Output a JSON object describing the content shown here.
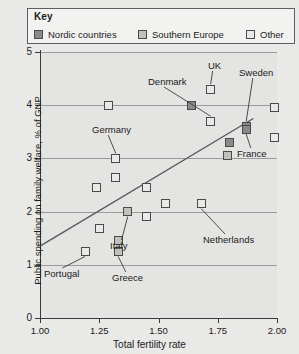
{
  "legend": {
    "title": "Key",
    "entries": [
      {
        "label": "Nordic countries",
        "key": "nordic",
        "color": "#8a8a8a"
      },
      {
        "label": "Southern Europe",
        "key": "south",
        "color": "#c0c0bd"
      },
      {
        "label": "Other",
        "key": "other",
        "color": "#e9e9e7"
      }
    ]
  },
  "axes": {
    "y_label": "Public spending on family welfare, % of GNP",
    "x_label": "Total fertility rate",
    "y_ticks": [
      "0",
      "1",
      "2",
      "3",
      "4",
      "5"
    ],
    "x_ticks": [
      "1.00",
      "1.25",
      "1.50",
      "1.75",
      "2.00"
    ]
  },
  "annotations": [
    {
      "text": "Denmark",
      "x": 148,
      "y": 76
    },
    {
      "text": "UK",
      "x": 208,
      "y": 60
    },
    {
      "text": "Sweden",
      "x": 239,
      "y": 67
    },
    {
      "text": "Germany",
      "x": 92,
      "y": 124
    },
    {
      "text": "France",
      "x": 237,
      "y": 148
    },
    {
      "text": "Netherlands",
      "x": 203,
      "y": 234
    },
    {
      "text": "Italy",
      "x": 110,
      "y": 240
    },
    {
      "text": "Portugal",
      "x": 44,
      "y": 268
    },
    {
      "text": "Greece",
      "x": 112,
      "y": 272
    }
  ],
  "chart_data": {
    "type": "scatter",
    "title": "",
    "xlabel": "Total fertility rate",
    "ylabel": "Public spending on family welfare, % of GNP",
    "xlim": [
      1.0,
      2.0
    ],
    "ylim": [
      0,
      5
    ],
    "xticks": [
      1.0,
      1.25,
      1.5,
      1.75,
      2.0
    ],
    "yticks": [
      0,
      1,
      2,
      3,
      4,
      5
    ],
    "grid": "horizontal",
    "legend_position": "top",
    "groups": [
      "Nordic countries",
      "Southern Europe",
      "Other"
    ],
    "trendline": {
      "x": [
        1.0,
        1.9
      ],
      "y": [
        1.35,
        3.75
      ]
    },
    "points": [
      {
        "label": "Denmark",
        "group": "Other",
        "x": 1.72,
        "y": 3.7
      },
      {
        "label": "UK",
        "group": "Other",
        "x": 1.72,
        "y": 4.3
      },
      {
        "label": "Sweden",
        "group": "Nordic countries",
        "x": 1.87,
        "y": 3.6
      },
      {
        "label": "Germany",
        "group": "Other",
        "x": 1.32,
        "y": 3.0
      },
      {
        "label": "France",
        "group": "Nordic countries",
        "x": 1.87,
        "y": 3.55
      },
      {
        "label": "Netherlands",
        "group": "Other",
        "x": 1.68,
        "y": 2.15
      },
      {
        "label": "Italy",
        "group": "Southern Europe",
        "x": 1.37,
        "y": 2.0
      },
      {
        "label": "Portugal",
        "group": "Other",
        "x": 1.19,
        "y": 1.25
      },
      {
        "label": "Greece",
        "group": "Southern Europe",
        "x": 1.33,
        "y": 1.25
      },
      {
        "label": "",
        "group": "Other",
        "x": 1.29,
        "y": 4.0
      },
      {
        "label": "",
        "group": "Nordic countries",
        "x": 1.64,
        "y": 4.0
      },
      {
        "label": "",
        "group": "Other",
        "x": 1.99,
        "y": 3.95
      },
      {
        "label": "",
        "group": "Other",
        "x": 1.99,
        "y": 3.4
      },
      {
        "label": "",
        "group": "Nordic countries",
        "x": 1.8,
        "y": 3.3
      },
      {
        "label": "",
        "group": "Southern Europe",
        "x": 1.79,
        "y": 3.05
      },
      {
        "label": "",
        "group": "Other",
        "x": 1.32,
        "y": 2.65
      },
      {
        "label": "",
        "group": "Other",
        "x": 1.24,
        "y": 2.45
      },
      {
        "label": "",
        "group": "Other",
        "x": 1.45,
        "y": 2.45
      },
      {
        "label": "",
        "group": "Other",
        "x": 1.53,
        "y": 2.15
      },
      {
        "label": "",
        "group": "Other",
        "x": 1.45,
        "y": 1.9
      },
      {
        "label": "",
        "group": "Other",
        "x": 1.25,
        "y": 1.68
      },
      {
        "label": "",
        "group": "Southern Europe",
        "x": 1.33,
        "y": 1.45
      }
    ]
  }
}
